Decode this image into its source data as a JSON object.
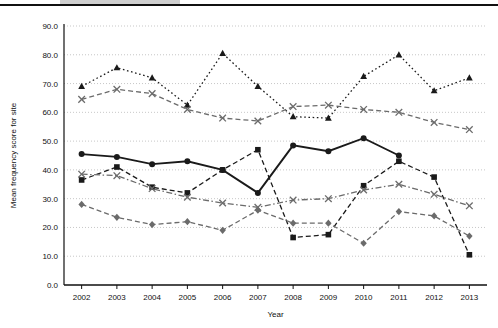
{
  "chart_data": {
    "type": "line",
    "title": "",
    "xlabel": "Year",
    "ylabel": "Mean frequency score for site",
    "categories": [
      2002,
      2003,
      2004,
      2005,
      2006,
      2007,
      2008,
      2009,
      2010,
      2011,
      2012,
      2013
    ],
    "ylim": [
      0,
      90
    ],
    "yticks": [
      0.0,
      10.0,
      20.0,
      30.0,
      40.0,
      50.0,
      60.0,
      70.0,
      80.0,
      90.0
    ],
    "ytick_labels": [
      "0.0",
      "10.0",
      "20.0",
      "30.0",
      "40.0",
      "50.0",
      "60.0",
      "70.0",
      "80.0",
      "90.0"
    ],
    "xtick_labels": [
      "2002",
      "2003",
      "2004",
      "2005",
      "2006",
      "2007",
      "2008",
      "2009",
      "2010",
      "2011",
      "2012",
      "2013"
    ],
    "grid": true,
    "grid_axis": "y",
    "legend": "none",
    "series": [
      {
        "name": "series-dotted-triangle",
        "marker": "triangle",
        "line_style": "dotted",
        "color": "#1a1a1a",
        "values": [
          69.0,
          75.5,
          72.0,
          62.5,
          80.5,
          69.0,
          58.5,
          58.0,
          72.5,
          80.0,
          67.5,
          72.0
        ]
      },
      {
        "name": "series-dashed-x-upper",
        "marker": "x",
        "line_style": "dashed",
        "color": "#6b6b6b",
        "values": [
          64.5,
          68.0,
          66.5,
          61.0,
          58.0,
          57.0,
          62.0,
          62.5,
          61.0,
          60.0,
          56.5,
          54.0
        ]
      },
      {
        "name": "series-solid-circle",
        "marker": "circle",
        "line_style": "solid",
        "color": "#1a1a1a",
        "values": [
          45.5,
          44.5,
          42.0,
          43.0,
          40.0,
          32.0,
          48.5,
          46.5,
          51.0,
          45.0,
          null,
          null
        ]
      },
      {
        "name": "series-dashed-square",
        "marker": "square",
        "line_style": "dashed",
        "color": "#1a1a1a",
        "values": [
          36.5,
          41.0,
          34.0,
          32.0,
          40.0,
          47.0,
          16.5,
          17.5,
          34.5,
          43.0,
          37.5,
          10.5
        ]
      },
      {
        "name": "series-dashdot-x-lower",
        "marker": "x",
        "line_style": "dashdot",
        "color": "#6b6b6b",
        "values": [
          38.5,
          38.0,
          33.5,
          30.5,
          28.5,
          27.0,
          29.5,
          30.0,
          33.0,
          35.0,
          31.5,
          27.5
        ]
      },
      {
        "name": "series-dashed-diamond",
        "marker": "diamond",
        "line_style": "dashed",
        "color": "#6b6b6b",
        "values": [
          28.0,
          23.5,
          21.0,
          22.0,
          19.0,
          26.0,
          21.5,
          21.5,
          14.5,
          25.5,
          24.0,
          17.0
        ]
      }
    ]
  }
}
